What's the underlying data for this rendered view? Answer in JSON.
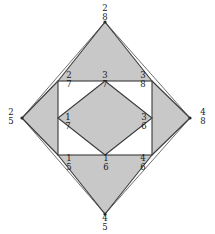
{
  "figure": {
    "type": "geometric-diagram",
    "colors": {
      "background": "#ffffff",
      "stroke": "#3a3a3a",
      "fill_shaded": "#c8c8c8",
      "fill_unshaded": "#ffffff",
      "label_text": "#1a1a1a"
    },
    "vertices": [
      {
        "id": "top",
        "num": "2",
        "den": "8",
        "x": 105,
        "y": 22,
        "label_x": 105,
        "label_y": 4
      },
      {
        "id": "left",
        "num": "2",
        "den": "5",
        "x": 22,
        "y": 118,
        "label_x": 10,
        "label_y": 108
      },
      {
        "id": "right",
        "num": "4",
        "den": "8",
        "x": 190,
        "y": 118,
        "label_x": 203,
        "label_y": 108
      },
      {
        "id": "bottom",
        "num": "4",
        "den": "5",
        "x": 105,
        "y": 214,
        "label_x": 105,
        "label_y": 214
      }
    ],
    "edge_labels": [
      {
        "id": "upper-left",
        "num": "2",
        "den": "7",
        "label_x": 69,
        "label_y": 71
      },
      {
        "id": "center-top",
        "num": "3",
        "den": "7",
        "label_x": 105,
        "label_y": 71
      },
      {
        "id": "upper-right",
        "num": "3",
        "den": "8",
        "label_x": 143,
        "label_y": 71
      },
      {
        "id": "inner-left",
        "num": "1",
        "den": "7",
        "label_x": 68,
        "label_y": 113
      },
      {
        "id": "inner-right",
        "num": "3",
        "den": "6",
        "label_x": 144,
        "label_y": 113
      },
      {
        "id": "lower-left",
        "num": "1",
        "den": "5",
        "label_x": 69,
        "label_y": 154
      },
      {
        "id": "center-bottom",
        "num": "1",
        "den": "6",
        "label_x": 106,
        "label_y": 154
      },
      {
        "id": "lower-right",
        "num": "4",
        "den": "6",
        "label_x": 143,
        "label_y": 154
      }
    ],
    "square": {
      "left": 58,
      "top": 81,
      "right": 152,
      "bottom": 155
    },
    "inner_diamond": {
      "top_x": 105,
      "top_y": 81,
      "right_x": 152,
      "right_y": 118,
      "bottom_x": 105,
      "bottom_y": 155,
      "left_x": 58,
      "left_y": 118
    }
  }
}
